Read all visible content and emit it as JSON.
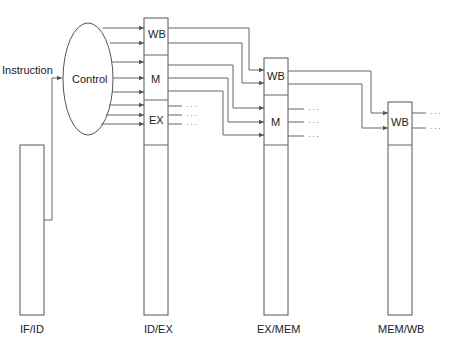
{
  "diagram": {
    "title": "",
    "input_label": "Instruction",
    "control_label": "Control",
    "ellipsis": "···",
    "registers": [
      {
        "id": "if_id",
        "label": "IF/ID"
      },
      {
        "id": "id_ex",
        "label": "ID/EX",
        "fields": [
          "WB",
          "M",
          "EX"
        ]
      },
      {
        "id": "ex_mem",
        "label": "EX/MEM",
        "fields": [
          "WB",
          "M"
        ]
      },
      {
        "id": "mem_wb",
        "label": "MEM/WB",
        "fields": [
          "WB"
        ]
      }
    ]
  }
}
